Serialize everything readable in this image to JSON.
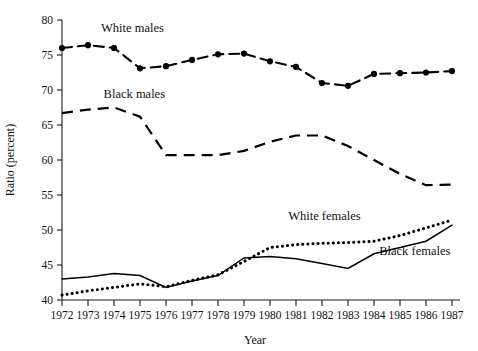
{
  "chart_data": {
    "type": "line",
    "title": "",
    "xlabel": "Year",
    "ylabel": "Ratio (percent)",
    "xlim": [
      1972,
      1987
    ],
    "ylim": [
      40,
      80
    ],
    "ytick_step": 5,
    "grid": false,
    "legend": "inline-annotations",
    "x": [
      1972,
      1973,
      1974,
      1975,
      1976,
      1977,
      1978,
      1979,
      1980,
      1981,
      1982,
      1983,
      1984,
      1985,
      1986,
      1987
    ],
    "xticklabels": [
      "1972",
      "1973",
      "1974",
      "1975",
      "1976",
      "1977",
      "1978",
      "1979",
      "1980",
      "1981",
      "1982",
      "1983",
      "1984",
      "1985",
      "1986",
      "1987"
    ],
    "yticklabels": [
      "40",
      "45",
      "50",
      "55",
      "60",
      "65",
      "70",
      "75",
      "80"
    ],
    "yticks": [
      40,
      45,
      50,
      55,
      60,
      65,
      70,
      75,
      80
    ],
    "series": [
      {
        "name": "White males",
        "style": "dashed-with-round-markers",
        "markers": true,
        "values": [
          76.0,
          76.4,
          76.0,
          73.1,
          73.4,
          74.3,
          75.1,
          75.2,
          74.1,
          73.3,
          71.0,
          70.6,
          72.3,
          72.4,
          72.5,
          72.7
        ]
      },
      {
        "name": "Black males",
        "style": "long-dashed",
        "markers": false,
        "values": [
          66.7,
          67.2,
          67.5,
          66.2,
          60.7,
          60.7,
          60.7,
          61.3,
          62.6,
          63.5,
          63.5,
          62.0,
          60.0,
          58.0,
          56.4,
          56.5
        ]
      },
      {
        "name": "White females",
        "style": "dotted",
        "markers": false,
        "values": [
          40.7,
          41.3,
          41.8,
          42.3,
          41.9,
          42.8,
          43.6,
          45.5,
          47.5,
          47.9,
          48.1,
          48.2,
          48.4,
          49.2,
          50.3,
          51.4
        ]
      },
      {
        "name": "Black females",
        "style": "solid",
        "markers": false,
        "values": [
          43.0,
          43.3,
          43.8,
          43.5,
          41.8,
          42.7,
          43.5,
          46.0,
          46.2,
          45.9,
          45.2,
          44.5,
          46.6,
          47.5,
          48.4,
          50.7
        ]
      }
    ],
    "series_black_males_actual": [
      66.7,
      67.2,
      67.5,
      66.2,
      60.7,
      60.7,
      60.7,
      61.3,
      62.6,
      63.5,
      63.5,
      62.0,
      60.0,
      58.0,
      56.4,
      56.5
    ],
    "annotations": [
      {
        "text": "White males",
        "x": 1973.5,
        "y": 78.3
      },
      {
        "text": "Black males",
        "x": 1973.6,
        "y": 68.9
      },
      {
        "text": "White females",
        "x": 1980.7,
        "y": 51.5
      },
      {
        "text": "Black females",
        "x": 1984.2,
        "y": 46.4
      }
    ]
  },
  "colors": {
    "ink": "#000000",
    "background": "#ffffff",
    "axis": "#1a1a1a"
  }
}
